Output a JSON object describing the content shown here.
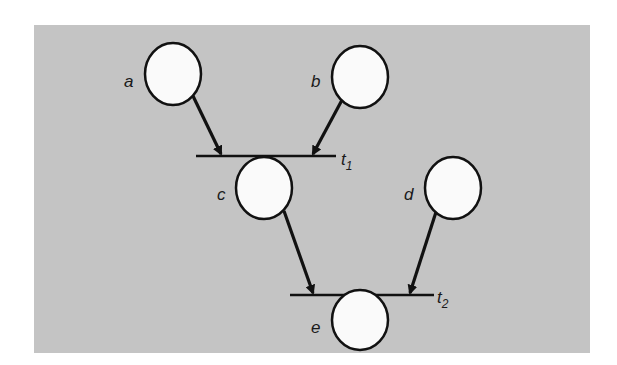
{
  "diagram": {
    "type": "petri-net",
    "background_color": "#c4c4c4",
    "place_fill": "#fafafa",
    "stroke_color": "#111111",
    "places": [
      {
        "id": "a",
        "label": "a",
        "cx": 173,
        "cy": 74,
        "rx": 28,
        "ry": 31
      },
      {
        "id": "b",
        "label": "b",
        "cx": 360,
        "cy": 77,
        "rx": 28,
        "ry": 31
      },
      {
        "id": "c",
        "label": "c",
        "cx": 264,
        "cy": 188,
        "rx": 28,
        "ry": 31
      },
      {
        "id": "d",
        "label": "d",
        "cx": 453,
        "cy": 188,
        "rx": 28,
        "ry": 31
      },
      {
        "id": "e",
        "label": "e",
        "cx": 360,
        "cy": 320,
        "rx": 28,
        "ry": 30
      }
    ],
    "transitions": [
      {
        "id": "t1",
        "label": "t",
        "subscript": "1",
        "x1": 196,
        "x2": 336,
        "y": 156
      },
      {
        "id": "t2",
        "label": "t",
        "subscript": "2",
        "x1": 290,
        "x2": 434,
        "y": 295
      }
    ],
    "arcs": [
      {
        "from": "a",
        "to": "t1"
      },
      {
        "from": "b",
        "to": "t1"
      },
      {
        "from": "t1",
        "to": "c"
      },
      {
        "from": "c",
        "to": "t2"
      },
      {
        "from": "d",
        "to": "t2"
      },
      {
        "from": "t2",
        "to": "e"
      }
    ]
  }
}
